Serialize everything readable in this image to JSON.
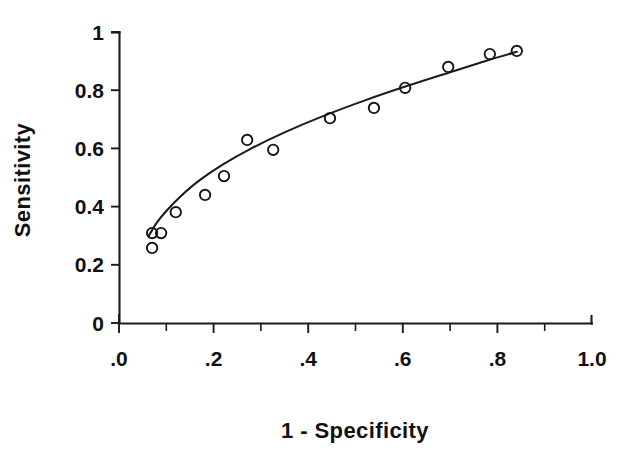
{
  "chart_data": {
    "type": "scatter",
    "title": "",
    "xlabel": "1 - Specificity",
    "ylabel": "Sensitivity",
    "xlim": [
      0,
      1
    ],
    "ylim": [
      0,
      1
    ],
    "grid": false,
    "legend": "none",
    "x_tick_labels": [
      ".0",
      ".2",
      ".4",
      ".6",
      ".8",
      "1.0"
    ],
    "x_tick_values": [
      0,
      0.2,
      0.4,
      0.6,
      0.8,
      1.0
    ],
    "x_minor_tick_values": [
      0.1,
      0.3,
      0.5,
      0.7,
      0.9
    ],
    "y_tick_labels": [
      "0",
      "0.2",
      "0.4",
      "0.6",
      "0.8",
      "1"
    ],
    "y_tick_values": [
      0,
      0.2,
      0.4,
      0.6,
      0.8,
      1.0
    ],
    "series": [
      {
        "name": "ROC points",
        "marker": "open-circle",
        "x": [
          0.07,
          0.07,
          0.089,
          0.12,
          0.182,
          0.222,
          0.271,
          0.326,
          0.446,
          0.539,
          0.605,
          0.696,
          0.784,
          0.841
        ],
        "y": [
          0.258,
          0.309,
          0.309,
          0.381,
          0.44,
          0.505,
          0.629,
          0.595,
          0.704,
          0.739,
          0.808,
          0.88,
          0.924,
          0.935
        ]
      },
      {
        "name": "Fitted ROC curve",
        "marker": "none",
        "x": [
          0.063,
          0.08,
          0.1,
          0.13,
          0.17,
          0.22,
          0.28,
          0.35,
          0.43,
          0.52,
          0.61,
          0.7,
          0.78,
          0.841
        ],
        "y": [
          0.3,
          0.345,
          0.385,
          0.435,
          0.49,
          0.545,
          0.6,
          0.655,
          0.71,
          0.765,
          0.815,
          0.862,
          0.903,
          0.932
        ]
      }
    ]
  },
  "labels": {
    "x_axis_title": "1 - Specificity",
    "y_axis_title": "Sensitivity"
  }
}
